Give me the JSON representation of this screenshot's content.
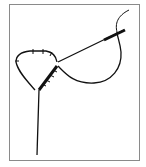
{
  "diagram": {
    "elements": [
      "frame",
      "stitched-loop",
      "thread-tail",
      "needle",
      "thread-loop",
      "thread-end"
    ],
    "colors": {
      "line": "#111111",
      "frame": "#8a8a8a",
      "background": "#ffffff"
    }
  }
}
